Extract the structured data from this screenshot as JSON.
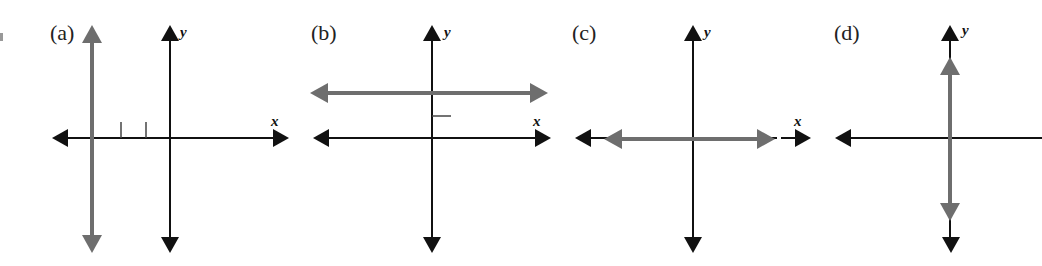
{
  "figure": {
    "panels": [
      {
        "label": "(a)",
        "x_axis_label": "x",
        "y_axis_label": "y",
        "description": "Vertical gray line to the left of the y-axis, tick marks on x-axis"
      },
      {
        "label": "(b)",
        "x_axis_label": "x",
        "y_axis_label": "y",
        "description": "Horizontal gray line above the x-axis, tick mark on y-axis"
      },
      {
        "label": "(c)",
        "x_axis_label": "x",
        "y_axis_label": "y",
        "description": "Horizontal gray line lying on the x-axis"
      },
      {
        "label": "(d)",
        "x_axis_label": "",
        "y_axis_label": "y",
        "description": "Vertical gray line lying on the y-axis"
      }
    ],
    "colors": {
      "axis": "#111111",
      "line": "#6e6e6e"
    }
  }
}
